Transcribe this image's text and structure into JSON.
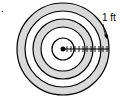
{
  "diagram": {
    "type": "concentric-target",
    "center": [
      63,
      49
    ],
    "rings": [
      {
        "radius": 46,
        "fill": "#d9d9d9"
      },
      {
        "radius": 38,
        "fill": "#ffffff"
      },
      {
        "radius": 30,
        "fill": "#d9d9d9"
      },
      {
        "radius": 22,
        "fill": "#ffffff"
      },
      {
        "radius": 11,
        "fill": "#ffffff"
      }
    ],
    "stroke_color": "#000000",
    "center_dot_radius": 2.5,
    "tick_count": 11,
    "tick_spacing": 4,
    "annotation": {
      "label": "1 ft",
      "arrow_target_band": "outer gray ring"
    },
    "corner_mark": "."
  }
}
